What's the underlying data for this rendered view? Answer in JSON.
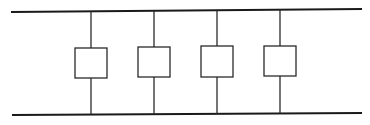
{
  "diagram": {
    "type": "parallel-ladder",
    "colors": {
      "line": "#1a1a1a",
      "background": "#ffffff",
      "box_fill": "#ffffff"
    },
    "rails": [
      {
        "name": "top-rail",
        "x1": 11,
        "y1": 12,
        "x2": 362,
        "y2": 9
      },
      {
        "name": "bottom-rail",
        "x1": 12,
        "y1": 115,
        "x2": 362,
        "y2": 113
      }
    ],
    "branches": [
      {
        "index": 1,
        "x": 91,
        "box": {
          "x": 75,
          "y": 48,
          "w": 32,
          "h": 30
        }
      },
      {
        "index": 2,
        "x": 154,
        "box": {
          "x": 138,
          "y": 47,
          "w": 32,
          "h": 30
        }
      },
      {
        "index": 3,
        "x": 217,
        "box": {
          "x": 201,
          "y": 46,
          "w": 32,
          "h": 31
        }
      },
      {
        "index": 4,
        "x": 280,
        "box": {
          "x": 264,
          "y": 46,
          "w": 32,
          "h": 30
        }
      }
    ]
  }
}
